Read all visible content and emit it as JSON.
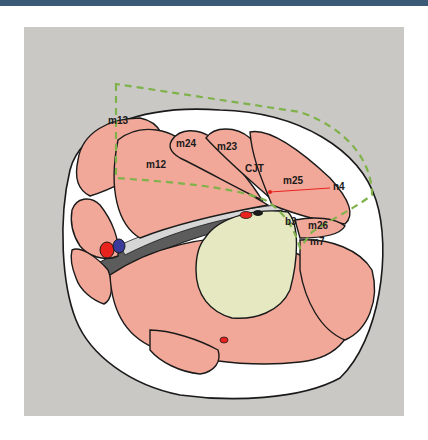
{
  "figure": {
    "type": "anatomical cross-section illustration",
    "labels": [
      {
        "id": "m13",
        "text": "m13",
        "x": 108,
        "y": 124
      },
      {
        "id": "m24",
        "text": "m24",
        "x": 176,
        "y": 147
      },
      {
        "id": "m23",
        "text": "m23",
        "x": 217,
        "y": 150
      },
      {
        "id": "m12",
        "text": "m12",
        "x": 146,
        "y": 168
      },
      {
        "id": "CJT",
        "text": "CJT",
        "x": 245,
        "y": 172
      },
      {
        "id": "m25",
        "text": "m25",
        "x": 283,
        "y": 184
      },
      {
        "id": "n4",
        "text": "n4",
        "x": 333,
        "y": 190
      },
      {
        "id": "b3",
        "text": "b3",
        "x": 285,
        "y": 225
      },
      {
        "id": "m26",
        "text": "m26",
        "x": 308,
        "y": 229
      },
      {
        "id": "m7",
        "text": "m7",
        "x": 310,
        "y": 245
      }
    ],
    "colors": {
      "background_panel": "#c9c8c4",
      "muscle": "#f2a898",
      "outline": "#1a1a1a",
      "fascia": "#ffffff",
      "central_mass": "#e6e8c2",
      "dashed_region": "#7fb24a",
      "artery": "#e8231d",
      "vein": "#3a3a9a",
      "nerve_line": "#e8231d",
      "gap_dark": "#5c5c5c",
      "gap_light": "#d6d6d6",
      "header_bar": "#3b5a78"
    }
  }
}
